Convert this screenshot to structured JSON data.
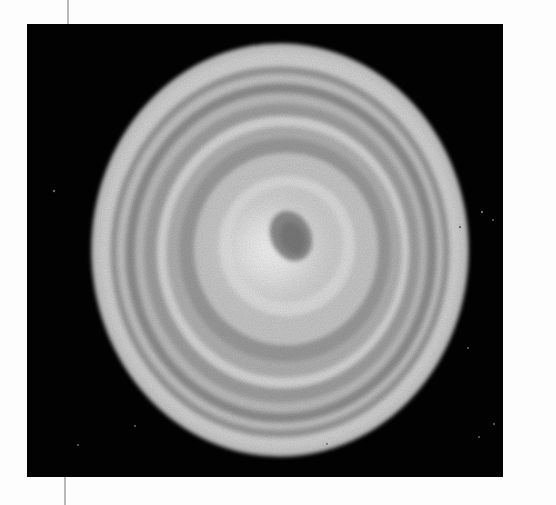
{
  "page": {
    "background": "#fdfdfd",
    "margin_rule_color": "#b8b8b8",
    "top_text_fragment": "·      ·                        ·"
  },
  "figure": {
    "background_color": "#020202",
    "colony": {
      "rings": 6,
      "edge_color": "#cfcfcf",
      "ring_dark_color": "#8e8e8e",
      "ring_light_color": "#d6d6d6",
      "center_color": "#f4f4f4",
      "center_spot_color": "#8a8a8a"
    }
  }
}
